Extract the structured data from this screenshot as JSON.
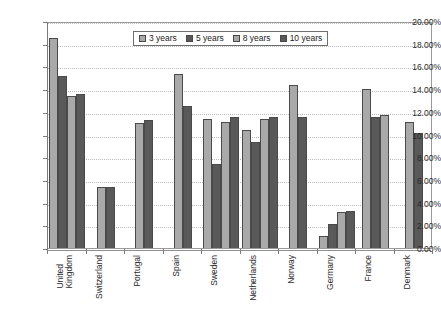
{
  "chart_data": {
    "type": "bar",
    "title": "",
    "subtitle": "",
    "xlabel": "",
    "ylabel": "",
    "ylim": [
      0,
      0.2
    ],
    "ytick_labels": [
      "20.00%",
      "18.00%",
      "16.00%",
      "14.00%",
      "12.00%",
      "10.00%",
      "8.00%",
      "6.00%",
      "4.00%",
      "2.00%",
      "0.00%"
    ],
    "ytick_values": [
      0.2,
      0.18,
      0.16,
      0.14,
      0.12,
      0.1,
      0.08,
      0.06,
      0.04,
      0.02,
      0.0
    ],
    "grid": true,
    "grid_axis": "y",
    "legend_position": "top-center",
    "categories": [
      "United\nKingdom",
      "Switzerland",
      "Portugal",
      "Spain",
      "Sweden",
      "Netherlands",
      "Norway",
      "Germany",
      "France",
      "Denmark"
    ],
    "series": [
      {
        "name": "3 years",
        "color": "#a9a9a9",
        "values": [
          18.5,
          5.4,
          11.0,
          15.35,
          11.4,
          10.4,
          14.4,
          1.1,
          14.0,
          11.1
        ]
      },
      {
        "name": "5 years",
        "color": "#595959",
        "values": [
          15.15,
          5.4,
          11.3,
          12.5,
          7.4,
          9.3,
          11.5,
          2.1,
          11.5,
          10.1
        ]
      },
      {
        "name": "8 years",
        "color": "#a9a9a9",
        "values": [
          13.4,
          null,
          null,
          null,
          11.1,
          11.4,
          null,
          3.2,
          11.7,
          null
        ]
      },
      {
        "name": "10 years",
        "color": "#595959",
        "values": [
          13.55,
          null,
          null,
          null,
          11.5,
          11.5,
          null,
          3.3,
          null,
          null
        ]
      }
    ],
    "value_unit": "percent"
  },
  "legend": {
    "items": [
      {
        "label": "3 years",
        "swatch": "light"
      },
      {
        "label": "5 years",
        "swatch": "dark"
      },
      {
        "label": "8 years",
        "swatch": "light"
      },
      {
        "label": "10 years",
        "swatch": "dark"
      }
    ]
  }
}
